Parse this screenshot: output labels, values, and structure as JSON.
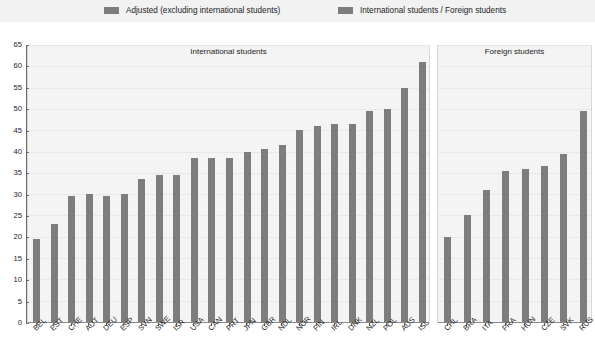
{
  "legend": {
    "items": [
      {
        "label": "Adjusted (excluding international students)",
        "color": "#7d7d7d",
        "swatch_name": "legend-swatch-adjusted"
      },
      {
        "label": "International students / Foreign students",
        "color": "#7d7d7d",
        "swatch_name": "legend-swatch-international"
      }
    ]
  },
  "axis": {
    "y_ticks": [
      "0",
      "5",
      "10",
      "15",
      "20",
      "25",
      "30",
      "35",
      "40",
      "45",
      "50",
      "55",
      "60",
      "65"
    ]
  },
  "panels": [
    {
      "title": "International students"
    },
    {
      "title": "Foreign students"
    }
  ],
  "chart_data": {
    "type": "bar",
    "title": "",
    "subtitle": "",
    "xlabel": "",
    "ylabel": "",
    "ylim": [
      0,
      65
    ],
    "ytick_step": 5,
    "grid": true,
    "legend_position": "top",
    "bar_color": "#7d7d7d",
    "panel_background": "#f4f4f4",
    "panels": [
      {
        "name": "International students",
        "categories": [
          "BEL",
          "EST",
          "CHE",
          "AUT",
          "DEU",
          "ESP",
          "SVN",
          "SWE",
          "ISR",
          "USA",
          "CAN",
          "PRT",
          "JPN",
          "GBR",
          "NDL",
          "NOR",
          "FIN",
          "IRL",
          "DNK",
          "NZL",
          "POL",
          "AUS",
          "ISL"
        ],
        "values": [
          19.5,
          23.0,
          29.5,
          30.0,
          29.5,
          30.0,
          33.5,
          34.5,
          34.5,
          38.5,
          38.5,
          38.5,
          40.0,
          40.5,
          41.5,
          45.0,
          46.0,
          46.5,
          46.5,
          49.5,
          50.0,
          55.0,
          61.0
        ]
      },
      {
        "name": "Foreign students",
        "categories": [
          "CHL",
          "BRA",
          "ITA",
          "FRA",
          "HUN",
          "CZE",
          "SVK",
          "RUS"
        ],
        "values": [
          20.0,
          25.0,
          31.0,
          35.5,
          36.0,
          36.5,
          39.5,
          49.5
        ]
      }
    ]
  }
}
